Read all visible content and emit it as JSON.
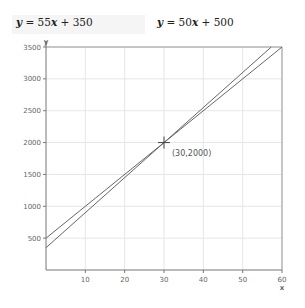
{
  "equations": [
    {
      "prefix": "y",
      "text": " = 55",
      "var": "x",
      "suffix": " + 350"
    },
    {
      "prefix": "y",
      "text": " = 50",
      "var": "x",
      "suffix": " + 500"
    }
  ],
  "chart_data": {
    "type": "line",
    "title": "",
    "xlabel": "x",
    "ylabel": "y",
    "xlim": [
      0,
      60
    ],
    "ylim": [
      0,
      3500
    ],
    "x_ticks": [
      10,
      20,
      30,
      40,
      50,
      60
    ],
    "y_ticks": [
      500,
      1000,
      1500,
      2000,
      2500,
      3000,
      3500
    ],
    "grid": true,
    "series": [
      {
        "name": "y = 55x + 350",
        "slope": 55,
        "intercept": 350,
        "x": [
          0,
          57.27
        ],
        "y": [
          350,
          3500
        ]
      },
      {
        "name": "y = 50x + 500",
        "slope": 50,
        "intercept": 500,
        "x": [
          0,
          60
        ],
        "y": [
          500,
          3500
        ]
      }
    ],
    "annotations": [
      {
        "type": "intersection",
        "x": 30,
        "y": 2000,
        "label": "(30,2000)"
      }
    ]
  }
}
